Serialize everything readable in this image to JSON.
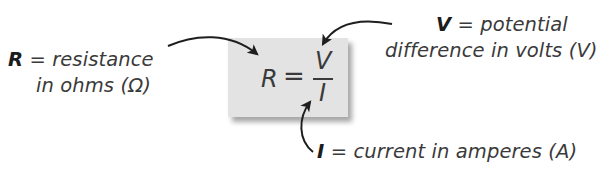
{
  "diagram": {
    "type": "annotated-formula",
    "formula": {
      "lhs": "R",
      "equals": "=",
      "numerator": "V",
      "denominator": "I",
      "box_color": "#e3e3e3"
    },
    "labels": {
      "resistance": {
        "symbol": "R",
        "line1_rest": " = resistance",
        "line2": "in ohms (Ω)"
      },
      "voltage": {
        "symbol": "V",
        "line1_rest": " = potential",
        "line2": "difference in volts (V)"
      },
      "current": {
        "symbol": "I",
        "rest": " = current in amperes (A)"
      }
    },
    "arrows": [
      {
        "from": "resistance-label",
        "to": "R"
      },
      {
        "from": "voltage-label",
        "to": "V"
      },
      {
        "from": "current-label",
        "to": "I"
      }
    ],
    "arrow_color": "#1e1e1e",
    "text_color": "#3a3a3a"
  }
}
